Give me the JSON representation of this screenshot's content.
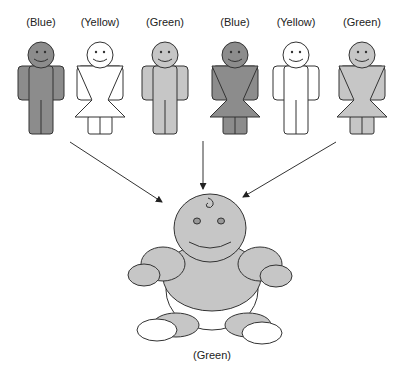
{
  "colors": {
    "blue": "#8c8c8c",
    "yellow": "#ffffff",
    "green": "#c6c6c6",
    "outline": "#333333"
  },
  "parents": [
    {
      "label": "(Blue)",
      "sex": "male",
      "color": "blue",
      "x": 41
    },
    {
      "label": "(Yellow)",
      "sex": "female",
      "color": "yellow",
      "x": 100
    },
    {
      "label": "(Green)",
      "sex": "male",
      "color": "green",
      "x": 165
    },
    {
      "label": "(Blue)",
      "sex": "female",
      "color": "blue",
      "x": 235
    },
    {
      "label": "(Yellow)",
      "sex": "male",
      "color": "yellow",
      "x": 296
    },
    {
      "label": "(Green)",
      "sex": "female",
      "color": "green",
      "x": 362
    }
  ],
  "offspring": {
    "label": "(Green)",
    "color": "green"
  },
  "arrows": [
    {
      "from": [
        70,
        142
      ],
      "to": [
        162,
        202
      ]
    },
    {
      "from": [
        203,
        141
      ],
      "to": [
        203,
        189
      ]
    },
    {
      "from": [
        336,
        142
      ],
      "to": [
        243,
        197
      ]
    }
  ]
}
